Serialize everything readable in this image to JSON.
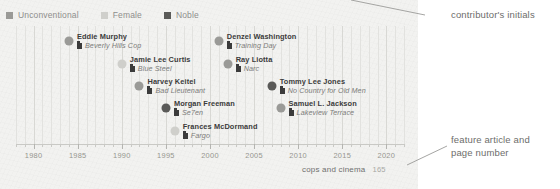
{
  "legend": {
    "items": [
      {
        "label": "Unconventional",
        "color": "#9a9a97",
        "swatch": "legend-swatch-unconventional"
      },
      {
        "label": "Female",
        "color": "#cfcfcb",
        "swatch": "legend-swatch-female"
      },
      {
        "label": "Noble",
        "color": "#5a5a58",
        "swatch": "legend-swatch-noble"
      }
    ]
  },
  "chart_data": {
    "type": "scatter",
    "title": "cops and cinema",
    "xlabel": "",
    "ylabel": "",
    "xlim": [
      1978,
      2022
    ],
    "grid": true,
    "legend_position": "top-left",
    "categories": [
      "Unconventional",
      "Female",
      "Noble"
    ],
    "tick_labels": [
      "1980",
      "1985",
      "1990",
      "1995",
      "2000",
      "2005",
      "2010",
      "2015",
      "2020"
    ],
    "tick_values": [
      1980,
      1985,
      1990,
      1995,
      2000,
      2005,
      2010,
      2015,
      2020
    ],
    "points": [
      {
        "name": "Eddie Murphy",
        "film": "Beverly Hills Cop",
        "year": 1984,
        "row": 1,
        "category": "Unconventional",
        "color": "#9a9a97"
      },
      {
        "name": "Denzel Washington",
        "film": "Training Day",
        "year": 2001,
        "row": 1,
        "category": "Unconventional",
        "color": "#9a9a97"
      },
      {
        "name": "Jamie Lee Curtis",
        "film": "Blue Steel",
        "year": 1990,
        "row": 2,
        "category": "Female",
        "color": "#cfcfcb"
      },
      {
        "name": "Ray Liotta",
        "film": "Narc",
        "year": 2002,
        "row": 2,
        "category": "Unconventional",
        "color": "#9a9a97"
      },
      {
        "name": "Harvey Keitel",
        "film": "Bad Lieutenant",
        "year": 1992,
        "row": 3,
        "category": "Unconventional",
        "color": "#9a9a97"
      },
      {
        "name": "Tommy Lee Jones",
        "film": "No Country for Old Men",
        "year": 2007,
        "row": 3,
        "category": "Noble",
        "color": "#5a5a58"
      },
      {
        "name": "Morgan Freeman",
        "film": "Se7en",
        "year": 1995,
        "row": 4,
        "category": "Noble",
        "color": "#5a5a58"
      },
      {
        "name": "Samuel L. Jackson",
        "film": "Lakeview Terrace",
        "year": 2008,
        "row": 4,
        "category": "Unconventional",
        "color": "#9a9a97"
      },
      {
        "name": "Frances McDormand",
        "film": "Fargo",
        "year": 1996,
        "row": 5,
        "category": "Female",
        "color": "#cfcfcb"
      }
    ]
  },
  "footer": {
    "title": "cops and cinema",
    "page": "165"
  },
  "annotations": [
    {
      "id": "contributor-initials",
      "text": "contributor's initials"
    },
    {
      "id": "feature-article",
      "text": "feature article and\npage number"
    }
  ],
  "colors": {
    "panel_background": "#f2f2f0",
    "gridline": "#e2e2df",
    "axis": "#c9c9c5",
    "text_primary": "#3b3b3b",
    "text_secondary": "#7c7c7a",
    "annotation": "#6d6d6b"
  }
}
